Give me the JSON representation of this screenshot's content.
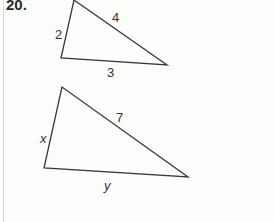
{
  "problem": {
    "number": "20."
  },
  "triangles": [
    {
      "name": "small-triangle",
      "sides": {
        "left": "2",
        "hypotenuse": "4",
        "bottom": "3"
      }
    },
    {
      "name": "large-triangle",
      "sides": {
        "left": "x",
        "hypotenuse": "7",
        "bottom": "y"
      }
    }
  ]
}
